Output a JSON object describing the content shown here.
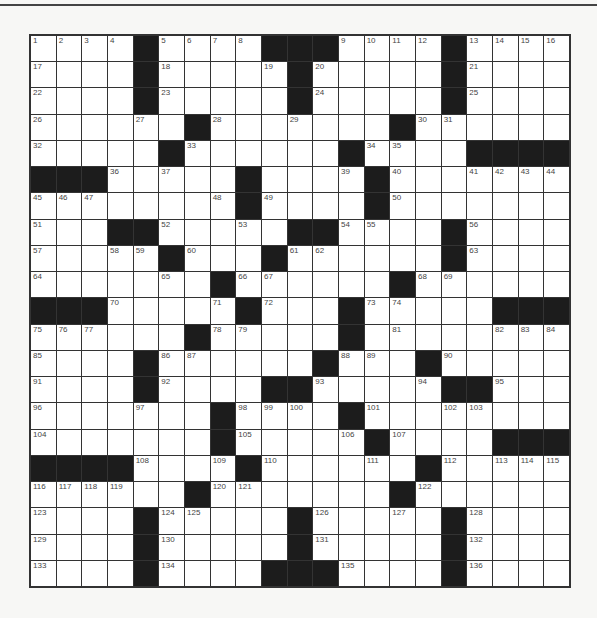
{
  "puzzle": {
    "rows": 21,
    "cols": 21,
    "colors": {
      "black": "#1c1c1c",
      "white": "#ffffff",
      "line": "#333333"
    },
    "grid": [
      "....#....###....#....",
      "....#.....#.....#....",
      "....#.....#.....#....",
      "......#.......#......",
      ".....#......#....####",
      "###.....#....#.......",
      "........#....#.......",
      "...##.....##....#....",
      ".....#...#......#....",
      ".......#......#......",
      "###.....#...#.....###",
      "......#.....#........",
      "....#......#...#.....",
      "....#....##.....##...",
      ".......#....#........",
      ".......#.....#....###",
      "####....#......#.....",
      "......#.......#......",
      "....#.....#.....#....",
      "....#.....#.....#....",
      "....#....###....#...."
    ],
    "numbers": [
      [
        0,
        0,
        1
      ],
      [
        0,
        1,
        2
      ],
      [
        0,
        2,
        3
      ],
      [
        0,
        3,
        4
      ],
      [
        0,
        5,
        5
      ],
      [
        0,
        6,
        6
      ],
      [
        0,
        7,
        7
      ],
      [
        0,
        8,
        8
      ],
      [
        0,
        12,
        9
      ],
      [
        0,
        13,
        10
      ],
      [
        0,
        14,
        11
      ],
      [
        0,
        15,
        12
      ],
      [
        0,
        17,
        13
      ],
      [
        0,
        18,
        14
      ],
      [
        0,
        19,
        15
      ],
      [
        0,
        20,
        16
      ],
      [
        1,
        0,
        17
      ],
      [
        1,
        5,
        18
      ],
      [
        1,
        9,
        19
      ],
      [
        1,
        11,
        20
      ],
      [
        1,
        17,
        21
      ],
      [
        2,
        0,
        22
      ],
      [
        2,
        5,
        23
      ],
      [
        2,
        11,
        24
      ],
      [
        2,
        17,
        25
      ],
      [
        3,
        0,
        26
      ],
      [
        3,
        4,
        27
      ],
      [
        3,
        7,
        28
      ],
      [
        3,
        10,
        29
      ],
      [
        3,
        15,
        30
      ],
      [
        3,
        16,
        31
      ],
      [
        4,
        0,
        32
      ],
      [
        4,
        6,
        33
      ],
      [
        4,
        13,
        34
      ],
      [
        4,
        14,
        35
      ],
      [
        5,
        3,
        36
      ],
      [
        5,
        5,
        37
      ],
      [
        5,
        8,
        38
      ],
      [
        5,
        12,
        39
      ],
      [
        5,
        14,
        40
      ],
      [
        5,
        17,
        41
      ],
      [
        5,
        18,
        42
      ],
      [
        5,
        19,
        43
      ],
      [
        5,
        20,
        44
      ],
      [
        6,
        0,
        45
      ],
      [
        6,
        1,
        46
      ],
      [
        6,
        2,
        47
      ],
      [
        6,
        7,
        48
      ],
      [
        6,
        9,
        49
      ],
      [
        6,
        14,
        50
      ],
      [
        7,
        0,
        51
      ],
      [
        7,
        5,
        52
      ],
      [
        7,
        8,
        53
      ],
      [
        7,
        12,
        54
      ],
      [
        7,
        13,
        55
      ],
      [
        7,
        17,
        56
      ],
      [
        8,
        0,
        57
      ],
      [
        8,
        3,
        58
      ],
      [
        8,
        4,
        59
      ],
      [
        8,
        6,
        60
      ],
      [
        8,
        10,
        61
      ],
      [
        8,
        11,
        62
      ],
      [
        8,
        17,
        63
      ],
      [
        9,
        0,
        64
      ],
      [
        9,
        5,
        65
      ],
      [
        9,
        8,
        66
      ],
      [
        9,
        9,
        67
      ],
      [
        9,
        15,
        68
      ],
      [
        9,
        16,
        69
      ],
      [
        10,
        3,
        70
      ],
      [
        10,
        7,
        71
      ],
      [
        10,
        9,
        72
      ],
      [
        10,
        13,
        73
      ],
      [
        10,
        14,
        74
      ],
      [
        11,
        0,
        75
      ],
      [
        11,
        1,
        76
      ],
      [
        11,
        2,
        77
      ],
      [
        11,
        7,
        78
      ],
      [
        11,
        8,
        79
      ],
      [
        11,
        12,
        80
      ],
      [
        11,
        14,
        81
      ],
      [
        11,
        18,
        82
      ],
      [
        11,
        19,
        83
      ],
      [
        11,
        20,
        84
      ],
      [
        12,
        0,
        85
      ],
      [
        12,
        5,
        86
      ],
      [
        12,
        6,
        87
      ],
      [
        12,
        12,
        88
      ],
      [
        12,
        13,
        89
      ],
      [
        12,
        16,
        90
      ],
      [
        13,
        0,
        91
      ],
      [
        13,
        5,
        92
      ],
      [
        13,
        11,
        93
      ],
      [
        13,
        15,
        94
      ],
      [
        13,
        18,
        95
      ],
      [
        14,
        0,
        96
      ],
      [
        14,
        4,
        97
      ],
      [
        14,
        8,
        98
      ],
      [
        14,
        9,
        99
      ],
      [
        14,
        10,
        100
      ],
      [
        14,
        13,
        101
      ],
      [
        14,
        16,
        102
      ],
      [
        14,
        17,
        103
      ],
      [
        15,
        0,
        104
      ],
      [
        15,
        8,
        105
      ],
      [
        15,
        12,
        106
      ],
      [
        15,
        14,
        107
      ],
      [
        16,
        4,
        108
      ],
      [
        16,
        7,
        109
      ],
      [
        16,
        9,
        110
      ],
      [
        16,
        13,
        111
      ],
      [
        16,
        16,
        112
      ],
      [
        16,
        18,
        113
      ],
      [
        16,
        19,
        114
      ],
      [
        16,
        20,
        115
      ],
      [
        17,
        0,
        116
      ],
      [
        17,
        1,
        117
      ],
      [
        17,
        2,
        118
      ],
      [
        17,
        3,
        119
      ],
      [
        17,
        7,
        120
      ],
      [
        17,
        8,
        121
      ],
      [
        17,
        15,
        122
      ],
      [
        18,
        0,
        123
      ],
      [
        18,
        5,
        124
      ],
      [
        18,
        6,
        125
      ],
      [
        18,
        11,
        126
      ],
      [
        18,
        14,
        127
      ],
      [
        18,
        17,
        128
      ],
      [
        19,
        0,
        129
      ],
      [
        19,
        5,
        130
      ],
      [
        19,
        11,
        131
      ],
      [
        19,
        17,
        132
      ],
      [
        20,
        0,
        133
      ],
      [
        20,
        5,
        134
      ],
      [
        20,
        12,
        135
      ],
      [
        20,
        17,
        136
      ]
    ]
  }
}
